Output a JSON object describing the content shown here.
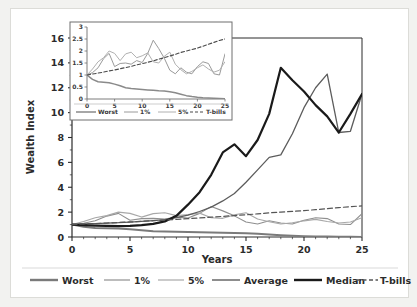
{
  "figure": {
    "background": "#f2f2f0",
    "card_background": "#ffffff"
  },
  "chart_data": {
    "type": "line",
    "title": "",
    "xlabel": "Years",
    "ylabel": "Wealth Index",
    "xlim": [
      0,
      25
    ],
    "ylim": [
      0,
      16
    ],
    "xticks": [
      0,
      5,
      10,
      15,
      20,
      25
    ],
    "yticks": [
      0,
      2,
      4,
      6,
      8,
      10,
      12,
      14,
      16
    ],
    "xtick_labels": [
      "0",
      "5",
      "10",
      "15",
      "20",
      "25"
    ],
    "ytick_labels": [
      "0",
      "2",
      "4",
      "6",
      "8",
      "10",
      "12",
      "14",
      "16"
    ],
    "grid": false,
    "legend_position": "bottom",
    "legend_entries": [
      "Worst",
      "1%",
      "5%",
      "Average",
      "Median",
      "T-bills"
    ],
    "series": [
      {
        "name": "Worst",
        "color": "#7a7a7a",
        "width": 2.0,
        "dash": "none",
        "x": [
          0,
          1,
          2,
          3,
          4,
          5,
          6,
          7,
          8,
          9,
          10,
          11,
          12,
          13,
          14,
          15,
          16,
          17,
          18,
          19,
          20,
          21,
          22,
          23,
          24,
          25
        ],
        "values": [
          1.0,
          0.82,
          0.72,
          0.7,
          0.68,
          0.62,
          0.55,
          0.47,
          0.44,
          0.42,
          0.4,
          0.38,
          0.36,
          0.34,
          0.33,
          0.3,
          0.26,
          0.2,
          0.14,
          0.1,
          0.07,
          0.05,
          0.04,
          0.03,
          0.02,
          0.01
        ]
      },
      {
        "name": "1%",
        "color": "#8f8f8f",
        "width": 1.1,
        "dash": "none",
        "x": [
          0,
          1,
          2,
          3,
          4,
          5,
          6,
          7,
          8,
          9,
          10,
          11,
          12,
          13,
          14,
          15,
          16,
          17,
          18,
          19,
          20,
          21,
          22,
          23,
          24,
          25
        ],
        "values": [
          1.0,
          1.1,
          1.3,
          1.68,
          1.9,
          1.35,
          1.48,
          1.5,
          1.45,
          1.6,
          1.52,
          1.9,
          2.45,
          2.1,
          1.7,
          1.2,
          1.05,
          1.3,
          1.12,
          1.05,
          1.35,
          1.55,
          1.48,
          1.05,
          1.0,
          1.88
        ]
      },
      {
        "name": "5%",
        "color": "#a8a8a8",
        "width": 1.1,
        "dash": "none",
        "x": [
          0,
          1,
          2,
          3,
          4,
          5,
          6,
          7,
          8,
          9,
          10,
          11,
          12,
          13,
          14,
          15,
          16,
          17,
          18,
          19,
          20,
          21,
          22,
          23,
          24,
          25
        ],
        "values": [
          1.0,
          1.25,
          1.55,
          1.72,
          2.0,
          1.9,
          1.6,
          1.88,
          1.95,
          1.72,
          1.8,
          1.92,
          1.55,
          1.5,
          1.78,
          1.95,
          1.45,
          1.22,
          1.05,
          1.15,
          1.3,
          1.42,
          1.25,
          1.12,
          1.2,
          1.55
        ]
      },
      {
        "name": "Average",
        "color": "#5c5c5c",
        "width": 1.3,
        "dash": "none",
        "x": [
          0,
          1,
          2,
          3,
          4,
          5,
          6,
          7,
          8,
          9,
          10,
          11,
          12,
          13,
          14,
          15,
          16,
          17,
          18,
          19,
          20,
          21,
          22,
          23,
          24,
          25
        ],
        "values": [
          1.0,
          1.05,
          1.08,
          1.12,
          1.15,
          1.2,
          1.25,
          1.32,
          1.4,
          1.55,
          1.75,
          2.05,
          2.4,
          2.9,
          3.5,
          4.4,
          5.4,
          6.4,
          6.6,
          8.3,
          10.4,
          12.0,
          13.1,
          8.4,
          8.5,
          11.5
        ]
      },
      {
        "name": "Median",
        "color": "#1a1a1a",
        "width": 2.2,
        "dash": "none",
        "x": [
          0,
          1,
          2,
          3,
          4,
          5,
          6,
          7,
          8,
          9,
          10,
          11,
          12,
          13,
          14,
          15,
          16,
          17,
          18,
          19,
          20,
          21,
          22,
          23,
          24,
          25
        ],
        "values": [
          1.0,
          0.95,
          0.92,
          0.9,
          0.88,
          0.9,
          0.95,
          1.05,
          1.25,
          1.7,
          2.6,
          3.6,
          5.0,
          6.8,
          7.45,
          6.5,
          7.8,
          9.9,
          13.6,
          12.6,
          11.7,
          10.6,
          9.7,
          8.4,
          9.9,
          11.5
        ]
      },
      {
        "name": "T-bills",
        "color": "#555555",
        "width": 1.2,
        "dash": "dashed",
        "x": [
          0,
          1,
          2,
          3,
          4,
          5,
          6,
          7,
          8,
          9,
          10,
          11,
          12,
          13,
          14,
          15,
          16,
          17,
          18,
          19,
          20,
          21,
          22,
          23,
          24,
          25
        ],
        "values": [
          1.0,
          1.04,
          1.08,
          1.12,
          1.17,
          1.21,
          1.26,
          1.31,
          1.36,
          1.42,
          1.47,
          1.53,
          1.59,
          1.66,
          1.72,
          1.79,
          1.86,
          1.94,
          2.0,
          2.06,
          2.12,
          2.2,
          2.28,
          2.36,
          2.44,
          2.5
        ]
      }
    ],
    "inset": {
      "type": "line",
      "xlabel": "",
      "ylabel": "",
      "xlim": [
        0,
        25
      ],
      "ylim": [
        0,
        3
      ],
      "xticks": [
        0,
        5,
        10,
        15,
        20,
        25
      ],
      "yticks": [
        0,
        0.5,
        1,
        1.5,
        2,
        2.5,
        3
      ],
      "xtick_labels": [
        "0",
        "5",
        "10",
        "15",
        "20",
        "25"
      ],
      "ytick_labels": [
        "0",
        "0.5",
        "1",
        "1.5",
        "2",
        "2.5",
        "3"
      ],
      "legend_entries": [
        "Worst",
        "1%",
        "5%",
        "T-bills"
      ],
      "series": [
        {
          "name": "Worst",
          "color": "#8a8a8a",
          "width": 1.5,
          "dash": "none",
          "x": [
            0,
            1,
            2,
            3,
            4,
            5,
            6,
            7,
            8,
            9,
            10,
            11,
            12,
            13,
            14,
            15,
            16,
            17,
            18,
            19,
            20,
            21,
            22,
            23,
            24,
            25
          ],
          "values": [
            1.0,
            0.82,
            0.72,
            0.7,
            0.68,
            0.62,
            0.55,
            0.47,
            0.44,
            0.42,
            0.4,
            0.38,
            0.36,
            0.34,
            0.33,
            0.3,
            0.26,
            0.2,
            0.14,
            0.1,
            0.07,
            0.05,
            0.04,
            0.03,
            0.02,
            0.01
          ]
        },
        {
          "name": "1%",
          "color": "#9a9a9a",
          "width": 1.0,
          "dash": "none",
          "x": [
            0,
            1,
            2,
            3,
            4,
            5,
            6,
            7,
            8,
            9,
            10,
            11,
            12,
            13,
            14,
            15,
            16,
            17,
            18,
            19,
            20,
            21,
            22,
            23,
            24,
            25
          ],
          "values": [
            1.0,
            1.1,
            1.3,
            1.68,
            1.9,
            1.35,
            1.48,
            1.5,
            1.45,
            1.6,
            1.52,
            1.9,
            2.45,
            2.1,
            1.7,
            1.2,
            1.05,
            1.3,
            1.12,
            1.05,
            1.35,
            1.55,
            1.48,
            1.05,
            1.0,
            1.88
          ]
        },
        {
          "name": "5%",
          "color": "#b0b0b0",
          "width": 1.0,
          "dash": "none",
          "x": [
            0,
            1,
            2,
            3,
            4,
            5,
            6,
            7,
            8,
            9,
            10,
            11,
            12,
            13,
            14,
            15,
            16,
            17,
            18,
            19,
            20,
            21,
            22,
            23,
            24,
            25
          ],
          "values": [
            1.0,
            1.25,
            1.55,
            1.72,
            2.0,
            1.9,
            1.6,
            1.88,
            1.95,
            1.72,
            1.8,
            1.92,
            1.55,
            1.5,
            1.78,
            1.95,
            1.45,
            1.22,
            1.05,
            1.15,
            1.3,
            1.42,
            1.25,
            1.12,
            1.2,
            1.55
          ]
        },
        {
          "name": "T-bills",
          "color": "#4a4a4a",
          "width": 1.1,
          "dash": "dashed",
          "x": [
            0,
            1,
            2,
            3,
            4,
            5,
            6,
            7,
            8,
            9,
            10,
            11,
            12,
            13,
            14,
            15,
            16,
            17,
            18,
            19,
            20,
            21,
            22,
            23,
            24,
            25
          ],
          "values": [
            1.0,
            1.04,
            1.08,
            1.12,
            1.17,
            1.21,
            1.26,
            1.31,
            1.36,
            1.42,
            1.47,
            1.53,
            1.59,
            1.66,
            1.72,
            1.79,
            1.86,
            1.94,
            2.0,
            2.06,
            2.12,
            2.2,
            2.28,
            2.36,
            2.44,
            2.5
          ]
        }
      ]
    }
  }
}
